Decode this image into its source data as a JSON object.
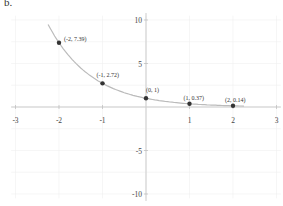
{
  "part_label": "b.",
  "chart_data": {
    "type": "line",
    "title": "",
    "function": "y = e^(-x)",
    "xlabel": "",
    "ylabel": "",
    "xlim": [
      -3,
      3
    ],
    "ylim": [
      -10,
      10
    ],
    "x_ticks": [
      "-3",
      "-2",
      "-1",
      "1",
      "2",
      "3"
    ],
    "y_ticks": [
      "10",
      "5",
      "-5",
      "-10"
    ],
    "grid": true,
    "points": [
      {
        "x": -2,
        "y": 7.39,
        "label": "(-2, 7.39)"
      },
      {
        "x": -1,
        "y": 2.72,
        "label": "(-1, 2.72)"
      },
      {
        "x": 0,
        "y": 1,
        "label": "(0, 1)"
      },
      {
        "x": 1,
        "y": 0.37,
        "label": "(1, 0.37)"
      },
      {
        "x": 2,
        "y": 0.14,
        "label": "(2, 0.14)"
      }
    ],
    "curve_color": "#bbbbbb",
    "point_color": "#333333"
  }
}
